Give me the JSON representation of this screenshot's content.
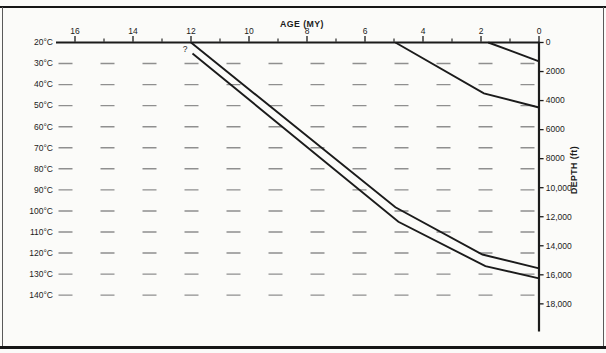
{
  "colors": {
    "ink": "#1b1b1b",
    "isotherm_dash": "#8f8f8f",
    "frame": "#161616",
    "background": "#fbfbf9"
  },
  "annotation": {
    "question_mark": "?"
  },
  "chart_data": {
    "type": "line",
    "title": "",
    "xlabel": "AGE (MY)",
    "ylabel": "DEPTH (ft)",
    "x_axis": {
      "title": "AGE (MY)",
      "position": "top",
      "range": [
        16.7,
        0
      ],
      "major_ticks": [
        16,
        14,
        12,
        10,
        8,
        6,
        4,
        2,
        0
      ],
      "major_tick_labels": [
        "16",
        "14",
        "12",
        "10",
        "8",
        "6",
        "4",
        "2",
        "0"
      ],
      "minor_ticks": [
        15,
        13,
        11,
        9,
        7,
        5,
        3,
        1
      ]
    },
    "y_axis": {
      "title": "DEPTH (ft)",
      "position": "right",
      "direction": "down",
      "range": [
        0,
        20000
      ],
      "tick_values": [
        0,
        2000,
        4000,
        6000,
        8000,
        10000,
        12000,
        14000,
        16000,
        18000
      ],
      "tick_labels": [
        "0",
        "2000",
        "4000",
        "6000",
        "8000",
        "10,000",
        "12,000",
        "14,000",
        "16,000",
        "18,000"
      ]
    },
    "isotherms": {
      "style": "dashed",
      "unit": "°C",
      "values": [
        20,
        30,
        40,
        50,
        60,
        70,
        80,
        90,
        100,
        110,
        120,
        130,
        140
      ],
      "labels": [
        "20°C",
        "30°C",
        "40°C",
        "50°C",
        "60°C",
        "70°C",
        "80°C",
        "90°C",
        "100°C",
        "110°C",
        "120°C",
        "130°C",
        "140°C"
      ],
      "surface_value": 20,
      "spacing_ft_per_10c": 1450
    },
    "series": [
      {
        "name": "unit-top-burial-curve",
        "points_age_my_depth_ft": [
          [
            12.0,
            0
          ],
          [
            4.95,
            11350
          ],
          [
            1.95,
            14600
          ],
          [
            0,
            15550
          ]
        ]
      },
      {
        "name": "unit-base-burial-curve",
        "points_age_my_depth_ft": [
          [
            11.95,
            750
          ],
          [
            4.85,
            12350
          ],
          [
            1.85,
            15400
          ],
          [
            0,
            16250
          ]
        ]
      },
      {
        "name": "younger-unit-burial-curve",
        "points_age_my_depth_ft": [
          [
            4.95,
            0
          ],
          [
            1.9,
            3500
          ],
          [
            0,
            4480
          ]
        ]
      },
      {
        "name": "youngest-unit-burial-curve",
        "points_age_my_depth_ft": [
          [
            1.75,
            0
          ],
          [
            0,
            1300
          ]
        ]
      }
    ],
    "annotations": [
      {
        "text": "?",
        "age_my": 12.2,
        "depth_ft": 420
      }
    ],
    "legend": "none",
    "grid": "dashed horizontal isotherm lines only"
  }
}
